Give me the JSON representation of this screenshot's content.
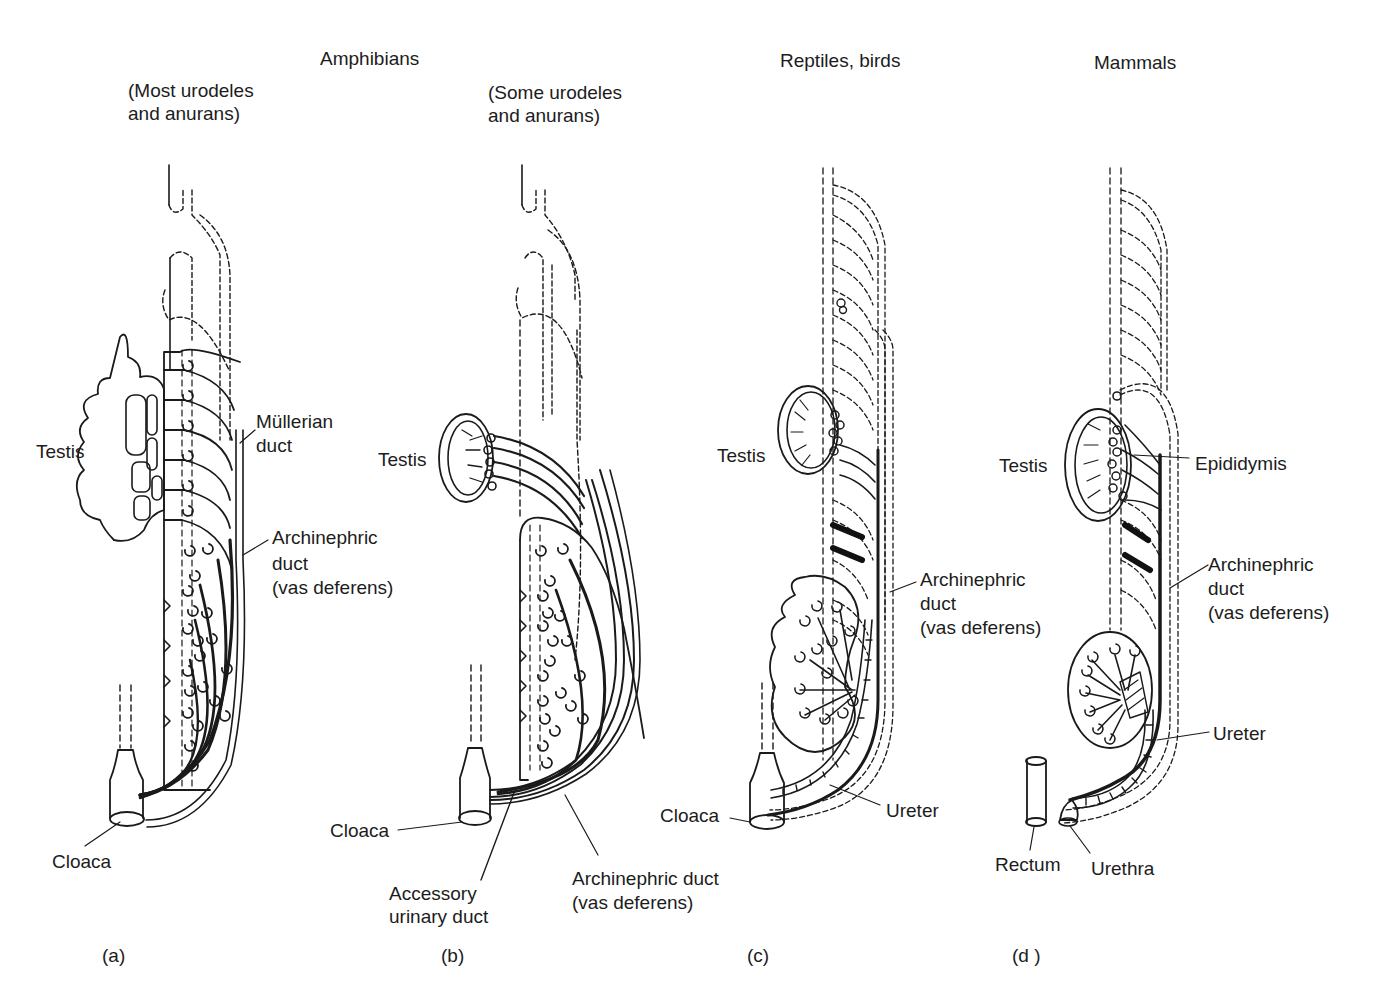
{
  "headers": {
    "amphibians": "Amphibians",
    "reptiles_birds": "Reptiles, birds",
    "mammals": "Mammals"
  },
  "panels": [
    {
      "id": "a",
      "panel_label": "(a)",
      "subtitle_line1": "(Most urodeles",
      "subtitle_line2": "and anurans)",
      "labels": {
        "testis": "Testis",
        "mullerian_line1": "Müllerian",
        "mullerian_line2": "duct",
        "archinephric_line1": "Archinephric",
        "archinephric_line2": "duct",
        "archinephric_line3": "(vas deferens)",
        "cloaca": "Cloaca"
      }
    },
    {
      "id": "b",
      "panel_label": "(b)",
      "subtitle_line1": "(Some urodeles",
      "subtitle_line2": "and anurans)",
      "labels": {
        "testis": "Testis",
        "cloaca": "Cloaca",
        "accessory_line1": "Accessory",
        "accessory_line2": "urinary duct",
        "archinephric_line1": "Archinephric duct",
        "archinephric_line2": "(vas deferens)"
      }
    },
    {
      "id": "c",
      "panel_label": "(c)",
      "labels": {
        "testis": "Testis",
        "archinephric_line1": "Archinephric",
        "archinephric_line2": "duct",
        "archinephric_line3": "(vas deferens)",
        "ureter": "Ureter",
        "cloaca": "Cloaca"
      }
    },
    {
      "id": "d",
      "panel_label": "(d )",
      "labels": {
        "testis": "Testis",
        "epididymis": "Epididymis",
        "archinephric_line1": "Archinephric",
        "archinephric_line2": "duct",
        "archinephric_line3": "(vas deferens)",
        "ureter": "Ureter",
        "rectum": "Rectum",
        "urethra": "Urethra"
      }
    }
  ],
  "colors": {
    "ink": "#1a1a1a",
    "background": "#ffffff"
  }
}
